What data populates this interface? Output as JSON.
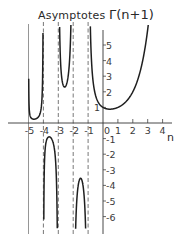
{
  "chart_data": {
    "type": "line",
    "title": "Γ(n+1)",
    "annotation": "Asymptotes",
    "xlabel": "n",
    "ylabel": "Γ(n+1)",
    "xlim": [
      -5.5,
      4.5
    ],
    "ylim": [
      -6.5,
      6.5
    ],
    "x_ticks": [
      -5,
      -4,
      -3,
      -2,
      -1,
      0,
      1,
      2,
      3,
      4
    ],
    "x_tick_labels": [
      "-5",
      "-4",
      "-3",
      "-2",
      "-1",
      "0",
      "1",
      "2",
      "3",
      "4"
    ],
    "y_ticks": [
      5,
      4,
      3,
      2,
      1,
      -1,
      -2,
      -3,
      -4,
      -5,
      -6
    ],
    "y_tick_labels": [
      "5",
      "4",
      "3",
      "2",
      "1",
      "-1",
      "-2",
      "-3",
      "-4",
      "-5",
      "-6"
    ],
    "asymptotes_x": [
      -5,
      -4,
      -3,
      -2,
      -1
    ],
    "grid": false,
    "legend": null,
    "series": [
      {
        "name": "Γ(n+1), n > -1",
        "x": [
          -0.95,
          -0.9,
          -0.8,
          -0.6,
          -0.4,
          0,
          0.46,
          1,
          1.5,
          2,
          2.5,
          3
        ],
        "values": [
          19.5,
          9.5,
          4.6,
          2.2,
          1.5,
          1.0,
          0.89,
          1.0,
          1.33,
          2.0,
          3.32,
          6.0
        ]
      },
      {
        "name": "Γ(n+1), -2 < n < -1",
        "x": [
          -1.95,
          -1.9,
          -1.7,
          -1.5,
          -1.3,
          -1.1,
          -1.05
        ],
        "values": [
          -21.0,
          -10.6,
          -4.3,
          -3.54,
          -4.6,
          -10.7,
          -20.6
        ]
      },
      {
        "name": "Γ(n+1), -3 < n < -2",
        "x": [
          -2.95,
          -2.9,
          -2.7,
          -2.5,
          -2.3,
          -2.1,
          -2.05
        ],
        "values": [
          10.3,
          5.6,
          2.6,
          2.36,
          2.9,
          5.6,
          10.2
        ]
      },
      {
        "name": "Γ(n+1), -4 < n < -3",
        "x": [
          -3.95,
          -3.9,
          -3.7,
          -3.6,
          -3.4,
          -3.2,
          -3.1,
          -3.05
        ],
        "values": [
          -5.4,
          -2.9,
          -1.1,
          -0.89,
          -1.05,
          -2.4,
          -4.9,
          -9.5
        ]
      },
      {
        "name": "Γ(n+1), -5 < n < -4",
        "x": [
          -4.95,
          -4.9,
          -4.7,
          -4.6,
          -4.4,
          -4.2,
          -4.1,
          -4.05
        ],
        "values": [
          5.6,
          1.46,
          0.32,
          0.25,
          0.29,
          0.55,
          1.2,
          2.3
        ]
      }
    ]
  },
  "labels": {
    "annotation": "Asymptotes",
    "function": "Γ(n+1)",
    "x_axis": "n"
  }
}
